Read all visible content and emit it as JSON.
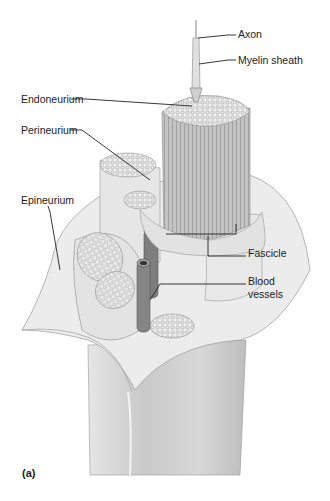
{
  "figure": {
    "panel_label": "(a)"
  },
  "labels": {
    "axon": "Axon",
    "myelin_sheath": "Myelin sheath",
    "endoneurium": "Endoneurium",
    "perineurium": "Perineurium",
    "epineurium": "Epineurium",
    "fascicle": "Fascicle",
    "blood_vessels_line1": "Blood",
    "blood_vessels_line2": "vessels"
  }
}
